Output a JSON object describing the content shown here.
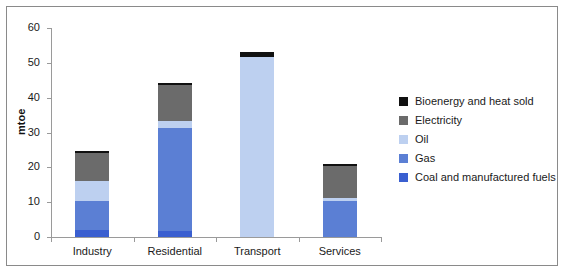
{
  "chart_data": {
    "type": "bar",
    "stacked": true,
    "title": "",
    "xlabel": "",
    "ylabel": "mtoe",
    "ylim": [
      0,
      60
    ],
    "yticks": [
      0,
      10,
      20,
      30,
      40,
      50,
      60
    ],
    "ytick_labels": [
      "0",
      "10",
      "20",
      "30",
      "40",
      "50",
      "60"
    ],
    "grid": false,
    "legend_position": "right",
    "categories": [
      "Industry",
      "Residential",
      "Transport",
      "Services"
    ],
    "series": [
      {
        "name": "Coal and manufactured fuels",
        "color": "#3a5fd0",
        "values": [
          2.0,
          1.6,
          0.0,
          0.0
        ]
      },
      {
        "name": "Gas",
        "color": "#5b7fd4",
        "values": [
          8.2,
          29.6,
          0.0,
          10.4
        ]
      },
      {
        "name": "Oil",
        "color": "#bdd0f0",
        "values": [
          5.8,
          2.0,
          51.8,
          0.8
        ]
      },
      {
        "name": "Electricity",
        "color": "#6b6b6b",
        "values": [
          8.0,
          10.4,
          0.0,
          9.2
        ]
      },
      {
        "name": "Bioenergy and heat sold",
        "color": "#111111",
        "values": [
          0.6,
          0.5,
          1.2,
          0.5
        ]
      }
    ],
    "totals": [
      24.6,
      44.1,
      53.0,
      20.9
    ]
  },
  "legend": {
    "entries": [
      {
        "label": "Bioenergy and heat sold",
        "color": "#111111"
      },
      {
        "label": "Electricity",
        "color": "#6b6b6b"
      },
      {
        "label": "Oil",
        "color": "#bdd0f0"
      },
      {
        "label": "Gas",
        "color": "#5b7fd4"
      },
      {
        "label": "Coal and manufactured fuels",
        "color": "#3a5fd0"
      }
    ]
  },
  "axis": {
    "y_title": "mtoe"
  },
  "colors": {
    "frame": "#8a8a8a",
    "axis": "#9a9a9a",
    "background": "#ffffff",
    "text": "#1a1a1a"
  }
}
